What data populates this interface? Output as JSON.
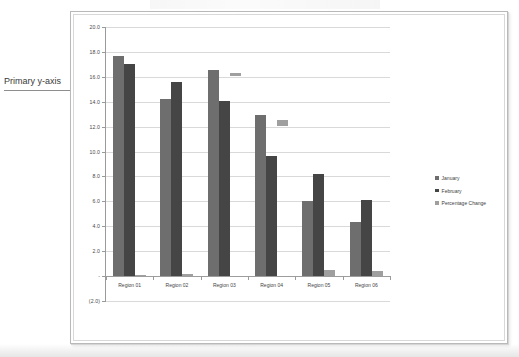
{
  "annotation": {
    "label": "Primary y-axis"
  },
  "legend": {
    "position": "right",
    "items": [
      {
        "label": "January",
        "color": "#6e6e6e"
      },
      {
        "label": "February",
        "color": "#454545"
      },
      {
        "label": "Percentage Change",
        "color": "#9f9f9f"
      }
    ]
  },
  "axis": {
    "y_ticks": [
      "20.0",
      "18.0",
      "16.0",
      "14.0",
      "12.0",
      "10.0",
      "8.0",
      "6.0",
      "4.0",
      "2.0",
      "-",
      "(2.0)"
    ],
    "x_ticks": [
      "Region 01",
      "Region 02",
      "Region 03",
      "Region 04",
      "Region 05",
      "Region 06"
    ]
  },
  "chart_data": {
    "type": "bar",
    "title": "",
    "subtitle": "",
    "xlabel": "",
    "ylabel": "",
    "ylim": [
      -2,
      20
    ],
    "ytick_values": [
      20,
      18,
      16,
      14,
      12,
      10,
      8,
      6,
      4,
      2,
      0,
      -2
    ],
    "ytick_labels": [
      "20.0",
      "18.0",
      "16.0",
      "14.0",
      "12.0",
      "10.0",
      "8.0",
      "6.0",
      "4.0",
      "2.0",
      "-",
      "(2.0)"
    ],
    "grid": true,
    "legend_position": "right",
    "categories": [
      "Region 01",
      "Region 02",
      "Region 03",
      "Region 04",
      "Region 05",
      "Region 06"
    ],
    "series": [
      {
        "name": "January",
        "color": "#6e6e6e",
        "values": [
          17.6,
          14.2,
          16.5,
          12.9,
          6.0,
          4.3
        ]
      },
      {
        "name": "February",
        "color": "#454545",
        "values": [
          17.0,
          15.5,
          14.0,
          9.6,
          8.2,
          6.1
        ]
      },
      {
        "name": "Percentage Change",
        "color": "#9f9f9f",
        "values": [
          0.1,
          0.15,
          -0.25,
          -0.45,
          0.45,
          0.4
        ]
      }
    ],
    "annotations": [
      {
        "text": "Primary y-axis",
        "target": "y-axis",
        "value": 14.6
      }
    ]
  }
}
